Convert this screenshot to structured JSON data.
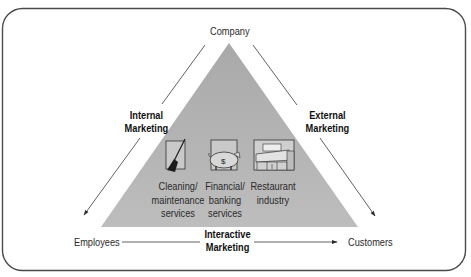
{
  "diagram": {
    "nodes": {
      "top": "Company",
      "bottom_left": "Employees",
      "bottom_right": "Customers"
    },
    "edges": {
      "left": {
        "line1": "Internal",
        "line2": "Marketing"
      },
      "right": {
        "line1": "External",
        "line2": "Marketing"
      },
      "bottom": {
        "line1": "Interactive",
        "line2": "Marketing"
      }
    },
    "services": [
      {
        "icon": "broom-icon",
        "line1": "Cleaning/",
        "line2": "maintenance",
        "line3": "services"
      },
      {
        "icon": "piggy-bank-icon",
        "line1": "Financial/",
        "line2": "banking",
        "line3": "services"
      },
      {
        "icon": "restaurant-counter-icon",
        "line1": "Restaurant",
        "line2": "industry",
        "line3": ""
      }
    ],
    "colors": {
      "triangle_fill": "#b3b3b3",
      "frame_stroke": "#4a4a4a",
      "line_stroke": "#3a3a3a"
    }
  }
}
